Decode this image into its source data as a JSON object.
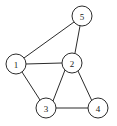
{
  "figure": {
    "width": 117,
    "height": 126,
    "background_color": "#ffffff",
    "stroke_color": "#2b2b2b",
    "node_fill_color": "#ffffff",
    "label_color": "#1a1a1a",
    "node_radius": 10
  },
  "chart_data": {
    "type": "diagram",
    "subtype": "node-link-graph",
    "title": "",
    "directed": false,
    "weighted": false,
    "grid": false,
    "legend": false,
    "node_count": 5,
    "edge_count": 7,
    "nodes": [
      {
        "id": "1",
        "label": "1",
        "x": 16,
        "y": 64,
        "degree": 3
      },
      {
        "id": "2",
        "label": "2",
        "x": 72,
        "y": 63,
        "degree": 4
      },
      {
        "id": "3",
        "label": "3",
        "x": 46,
        "y": 108,
        "degree": 3
      },
      {
        "id": "4",
        "label": "4",
        "x": 98,
        "y": 108,
        "degree": 2
      },
      {
        "id": "5",
        "label": "5",
        "x": 82,
        "y": 16,
        "degree": 2
      }
    ],
    "edges": [
      {
        "source": "1",
        "target": "5",
        "x1": 24,
        "y1": 58,
        "x2": 74,
        "y2": 22
      },
      {
        "source": "1",
        "target": "2",
        "x1": 26,
        "y1": 64,
        "x2": 62,
        "y2": 63
      },
      {
        "source": "1",
        "target": "3",
        "x1": 22,
        "y1": 72,
        "x2": 40,
        "y2": 100
      },
      {
        "source": "2",
        "target": "5",
        "x1": 75,
        "y1": 53,
        "x2": 80,
        "y2": 26
      },
      {
        "source": "2",
        "target": "3",
        "x1": 65,
        "y1": 70,
        "x2": 53,
        "y2": 101
      },
      {
        "source": "2",
        "target": "4",
        "x1": 78,
        "y1": 71,
        "x2": 92,
        "y2": 101
      },
      {
        "source": "3",
        "target": "4",
        "x1": 56,
        "y1": 108,
        "x2": 88,
        "y2": 108
      }
    ],
    "adjacency": {
      "1": [
        "2",
        "3",
        "5"
      ],
      "2": [
        "1",
        "3",
        "4",
        "5"
      ],
      "3": [
        "1",
        "2",
        "4"
      ],
      "4": [
        "2",
        "3"
      ],
      "5": [
        "1",
        "2"
      ]
    }
  }
}
